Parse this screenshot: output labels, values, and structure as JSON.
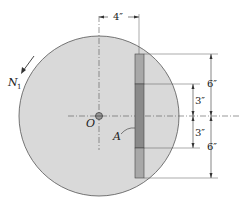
{
  "diagram": {
    "rotation_label": "N",
    "rotation_subscript": "1",
    "center_label": "O",
    "point_label": "A",
    "dims": {
      "horizontal": "4″",
      "upper_outer": "6″",
      "upper_inner": "3″",
      "lower_inner": "3″",
      "lower_outer": "6″"
    },
    "colors": {
      "disk": "#d9d9d9",
      "bar_dark": "#8a8a8a",
      "bar_light": "#a8a8a8",
      "line": "#333333"
    }
  }
}
